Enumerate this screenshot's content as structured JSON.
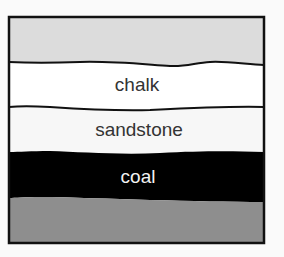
{
  "diagram": {
    "title": "",
    "colors": {
      "background": "#fafafa",
      "frame": "#111111",
      "boundary": "#111111"
    },
    "layers": [
      {
        "name": "top-layer",
        "label": "",
        "fill": "#dcdcdc",
        "text_color": "#333333"
      },
      {
        "name": "chalk",
        "label": "chalk",
        "fill": "#ffffff",
        "text_color": "#333333"
      },
      {
        "name": "sandstone",
        "label": "sandstone",
        "fill": "#f7f7f7",
        "text_color": "#333333"
      },
      {
        "name": "coal",
        "label": "coal",
        "fill": "#000000",
        "text_color": "#f2f2f2"
      },
      {
        "name": "bottom-layer",
        "label": "",
        "fill": "#8e8e8e",
        "text_color": "#333333"
      }
    ]
  }
}
